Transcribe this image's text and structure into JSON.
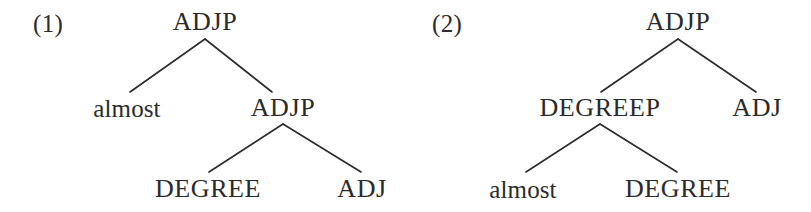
{
  "figure": {
    "caption": "",
    "background_color": "#ffffff",
    "text_color": "#2b2b2b",
    "line_color": "#2b2b2b"
  },
  "examples": [
    {
      "number": "(1)",
      "number_x": 33,
      "number_y": 23,
      "tree": {
        "nodes": [
          {
            "id": "t1-root",
            "label": "ADJP",
            "kind": "category",
            "x": 205,
            "y": 22
          },
          {
            "id": "t1-almost",
            "label": "almost",
            "kind": "word",
            "x": 127,
            "y": 108
          },
          {
            "id": "t1-adjp2",
            "label": "ADJP",
            "kind": "category",
            "x": 283,
            "y": 108
          },
          {
            "id": "t1-degree",
            "label": "DEGREE",
            "kind": "category",
            "x": 208,
            "y": 189
          },
          {
            "id": "t1-adj",
            "label": "ADJ",
            "kind": "category",
            "x": 362,
            "y": 189
          }
        ],
        "edges": [
          {
            "from": "t1-root",
            "to": "t1-almost",
            "x1": 205,
            "y1": 39,
            "x2": 130,
            "y2": 92
          },
          {
            "from": "t1-root",
            "to": "t1-adjp2",
            "x1": 205,
            "y1": 39,
            "x2": 272,
            "y2": 92
          },
          {
            "from": "t1-adjp2",
            "to": "t1-degree",
            "x1": 283,
            "y1": 124,
            "x2": 209,
            "y2": 172
          },
          {
            "from": "t1-adjp2",
            "to": "t1-adj",
            "x1": 283,
            "y1": 124,
            "x2": 361,
            "y2": 172
          }
        ]
      }
    },
    {
      "number": "(2)",
      "number_x": 432,
      "number_y": 23,
      "tree": {
        "nodes": [
          {
            "id": "t2-root",
            "label": "ADJP",
            "kind": "category",
            "x": 678,
            "y": 22
          },
          {
            "id": "t2-degreep",
            "label": "DEGREEP",
            "kind": "category",
            "x": 600,
            "y": 108
          },
          {
            "id": "t2-adj",
            "label": "ADJ",
            "kind": "category",
            "x": 757,
            "y": 108
          },
          {
            "id": "t2-almost",
            "label": "almost",
            "kind": "word",
            "x": 523,
            "y": 189
          },
          {
            "id": "t2-degree",
            "label": "DEGREE",
            "kind": "category",
            "x": 678,
            "y": 189
          }
        ],
        "edges": [
          {
            "from": "t2-root",
            "to": "t2-degreep",
            "x1": 678,
            "y1": 39,
            "x2": 601,
            "y2": 92
          },
          {
            "from": "t2-root",
            "to": "t2-adj",
            "x1": 678,
            "y1": 39,
            "x2": 756,
            "y2": 92
          },
          {
            "from": "t2-degreep",
            "to": "t2-almost",
            "x1": 600,
            "y1": 124,
            "x2": 526,
            "y2": 172
          },
          {
            "from": "t2-degreep",
            "to": "t2-degree",
            "x1": 600,
            "y1": 124,
            "x2": 677,
            "y2": 172
          }
        ]
      }
    }
  ]
}
